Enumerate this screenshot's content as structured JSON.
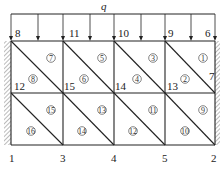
{
  "diagram": {
    "load": {
      "label": "q"
    },
    "nodes": [
      {
        "id": "1",
        "x": 11,
        "y": 145
      },
      {
        "id": "3",
        "x": 63,
        "y": 145
      },
      {
        "id": "4",
        "x": 114,
        "y": 145
      },
      {
        "id": "5",
        "x": 165,
        "y": 145
      },
      {
        "id": "2",
        "x": 215,
        "y": 145
      },
      {
        "id": "12",
        "x": 11,
        "y": 93
      },
      {
        "id": "15",
        "x": 63,
        "y": 93
      },
      {
        "id": "14",
        "x": 114,
        "y": 93
      },
      {
        "id": "13",
        "x": 165,
        "y": 93
      },
      {
        "id": "7",
        "x": 215,
        "y": 93
      },
      {
        "id": "8",
        "x": 11,
        "y": 41
      },
      {
        "id": "11",
        "x": 63,
        "y": 41
      },
      {
        "id": "10",
        "x": 114,
        "y": 41
      },
      {
        "id": "9",
        "x": 165,
        "y": 41
      },
      {
        "id": "6",
        "x": 215,
        "y": 41
      }
    ],
    "node_labels": [
      {
        "text": "8",
        "x": 15,
        "y": 37
      },
      {
        "text": "11",
        "x": 69,
        "y": 37
      },
      {
        "text": "10",
        "x": 118,
        "y": 37
      },
      {
        "text": "9",
        "x": 168,
        "y": 37
      },
      {
        "text": "6",
        "x": 205,
        "y": 37
      },
      {
        "text": "12",
        "x": 14,
        "y": 90
      },
      {
        "text": "15",
        "x": 64,
        "y": 90
      },
      {
        "text": "14",
        "x": 115,
        "y": 90
      },
      {
        "text": "13",
        "x": 167,
        "y": 90
      },
      {
        "text": "7",
        "x": 209,
        "y": 80
      },
      {
        "text": "1",
        "x": 9,
        "y": 162
      },
      {
        "text": "3",
        "x": 60,
        "y": 162
      },
      {
        "text": "4",
        "x": 111,
        "y": 162
      },
      {
        "text": "5",
        "x": 162,
        "y": 162
      },
      {
        "text": "2",
        "x": 211,
        "y": 162
      }
    ],
    "elements": [
      {
        "id": "1",
        "symbol": "①",
        "x": 203,
        "y": 58
      },
      {
        "id": "2",
        "symbol": "②",
        "x": 185,
        "y": 79
      },
      {
        "id": "3",
        "symbol": "③",
        "x": 153,
        "y": 58
      },
      {
        "id": "4",
        "symbol": "④",
        "x": 137,
        "y": 79
      },
      {
        "id": "5",
        "symbol": "⑤",
        "x": 102,
        "y": 58
      },
      {
        "id": "6",
        "symbol": "⑥",
        "x": 84,
        "y": 79
      },
      {
        "id": "7",
        "symbol": "⑦",
        "x": 51,
        "y": 58
      },
      {
        "id": "8",
        "symbol": "⑧",
        "x": 33,
        "y": 79
      },
      {
        "id": "9",
        "symbol": "⑨",
        "x": 203,
        "y": 110
      },
      {
        "id": "10",
        "symbol": "⑩",
        "x": 185,
        "y": 131
      },
      {
        "id": "11",
        "symbol": "⑪",
        "x": 153,
        "y": 110
      },
      {
        "id": "12",
        "symbol": "⑫",
        "x": 133,
        "y": 131
      },
      {
        "id": "13",
        "symbol": "⑬",
        "x": 102,
        "y": 110
      },
      {
        "id": "14",
        "symbol": "⑭",
        "x": 82,
        "y": 131
      },
      {
        "id": "15",
        "symbol": "⑮",
        "x": 51,
        "y": 110
      },
      {
        "id": "16",
        "symbol": "⑯",
        "x": 31,
        "y": 131
      }
    ],
    "load_arrows_x": [
      11,
      38,
      63,
      90,
      114,
      141,
      165,
      191,
      215
    ],
    "colors": {
      "line": "#222222",
      "hatch": "#777777",
      "background": "#ffffff"
    }
  }
}
